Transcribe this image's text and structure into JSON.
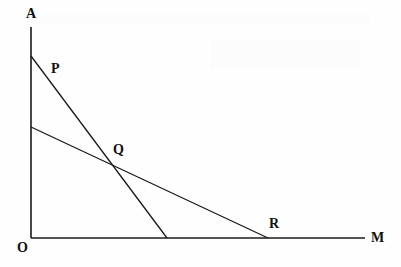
{
  "figure": {
    "background_color": "#fefefe",
    "stroke_color": "#1a1a1a",
    "label_color": "#111111",
    "width": 401,
    "height": 267
  },
  "chart_data": {
    "type": "line",
    "title": "",
    "xlabel": "M",
    "ylabel": "A",
    "grid": false,
    "legend": "none",
    "axis_origin_label": "O",
    "xlim": [
      31,
      365
    ],
    "ylim": [
      238,
      27
    ],
    "axes": [
      {
        "name": "vertical-axis",
        "label": "A",
        "from": {
          "x": 31,
          "y": 238
        },
        "to": {
          "x": 31,
          "y": 27
        }
      },
      {
        "name": "horizontal-axis",
        "label": "M",
        "from": {
          "x": 31,
          "y": 238
        },
        "to": {
          "x": 365,
          "y": 238
        }
      }
    ],
    "series": [
      {
        "name": "steep-line-P",
        "label": "P",
        "points": [
          {
            "x": 31,
            "y": 56
          },
          {
            "x": 167,
            "y": 238
          }
        ]
      },
      {
        "name": "shallow-line-R",
        "label": "R",
        "points": [
          {
            "x": 31,
            "y": 127
          },
          {
            "x": 268,
            "y": 238
          }
        ]
      }
    ],
    "annotations": [
      {
        "name": "intersection-point",
        "label": "Q",
        "x": 112,
        "y": 163
      }
    ]
  },
  "labels": {
    "a": "A",
    "p": "P",
    "q": "Q",
    "r": "R",
    "o": "O",
    "m": "M"
  }
}
